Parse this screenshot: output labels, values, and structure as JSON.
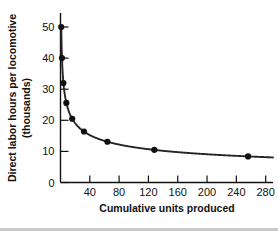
{
  "chart_data": {
    "type": "line",
    "title": "",
    "xlabel": "Cumulative units produced",
    "ylabel": "Direct labor hours per locomotive (thousands)",
    "ylabel_line1": "Direct labor hours per locomotive",
    "ylabel_line2": "(thousands)",
    "xlim": [
      0,
      290
    ],
    "ylim": [
      0,
      55
    ],
    "xticks": [
      40,
      80,
      120,
      160,
      200,
      240,
      280
    ],
    "yticks": [
      0,
      10,
      20,
      30,
      40,
      50
    ],
    "xtick_labels": [
      "40",
      "80",
      "120",
      "160",
      "200",
      "240",
      "280"
    ],
    "ytick_labels": [
      "0",
      "10",
      "20",
      "30",
      "40",
      "50"
    ],
    "grid": false,
    "legend": "none",
    "marker": "filled-circle",
    "series": [
      {
        "name": "Direct labor hours per locomotive",
        "x": [
          1,
          2,
          4,
          8,
          16,
          32,
          64,
          128,
          256
        ],
        "values": [
          50.0,
          40.0,
          32.0,
          25.6,
          20.5,
          16.4,
          13.1,
          10.5,
          8.4
        ]
      }
    ],
    "curve_note": "80% learning curve: each doubling of cumulative units reduces hours to 80%"
  },
  "axes": {
    "x_axis_name": "cumulative-units-axis",
    "y_axis_name": "labor-hours-axis"
  }
}
